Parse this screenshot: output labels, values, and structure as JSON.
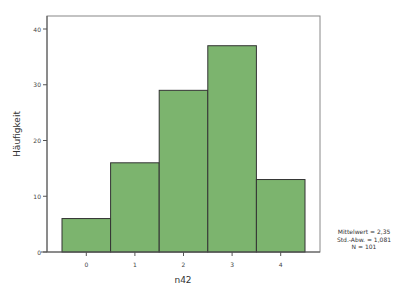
{
  "chart_data": {
    "type": "bar",
    "title": "",
    "xlabel": "n42",
    "ylabel": "Häufigkeit",
    "categories": [
      "0",
      "1",
      "2",
      "3",
      "4"
    ],
    "values": [
      6,
      16,
      29,
      37,
      13
    ],
    "yticks": [
      0,
      10,
      20,
      30,
      40
    ],
    "ylim": [
      0,
      42
    ],
    "grid": false,
    "bar_color": "#7cb46e",
    "bar_edge_color": "#333333",
    "annotations": {
      "mean": "Mittelwert = 2,35",
      "sd": "Std.-Abw. = 1,081",
      "n": "N = 101"
    }
  }
}
